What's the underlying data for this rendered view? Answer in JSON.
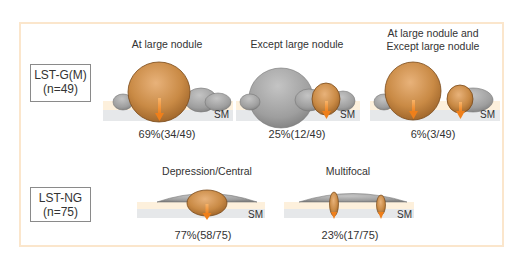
{
  "groups": [
    {
      "label": "LST-G(M)",
      "n": "(n=49)",
      "panels": [
        {
          "title": "At large nodule",
          "layer_label": "SM",
          "result": "69%(34/49)"
        },
        {
          "title": "Except large nodule",
          "layer_label": "SM",
          "result": "25%(12/49)"
        },
        {
          "title_line1": "At large nodule and",
          "title_line2": "Except large nodule",
          "layer_label": "SM",
          "result": "6%(3/49)"
        }
      ]
    },
    {
      "label": "LST-NG",
      "n": "(n=75)",
      "panels": [
        {
          "title": "Depression/Central",
          "layer_label": "SM",
          "result": "77%(58/75)"
        },
        {
          "title": "Multifocal",
          "layer_label": "SM",
          "result": "23%(17/75)"
        }
      ]
    }
  ],
  "colors": {
    "frame": "#fbe6cc",
    "mucosa_layer": "#fdf0dc",
    "submucosa_layer": "#e6e8ea",
    "nodule_gray": "#a3a3a3",
    "nodule_orange": "#c98a45",
    "arrow": "#f08a2a"
  }
}
